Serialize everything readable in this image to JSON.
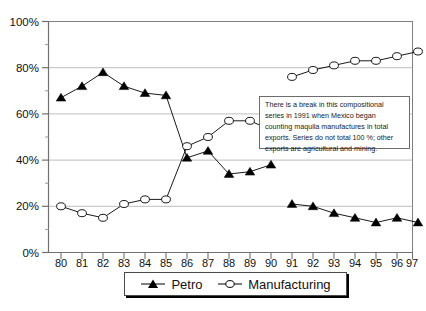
{
  "chart_data": {
    "type": "line",
    "title": "",
    "subtitle": "",
    "xlabel": "",
    "ylabel": "",
    "ylim": [
      0,
      100
    ],
    "ytick_labels": [
      "0%",
      "20%",
      "40%",
      "60%",
      "80%",
      "100%"
    ],
    "ytick_values": [
      0,
      20,
      40,
      60,
      80,
      100
    ],
    "minor_tick_values": [
      10,
      30,
      50,
      70,
      90
    ],
    "grid": "horizontal-major",
    "legend_position": "bottom",
    "axis_break": {
      "present": true,
      "between": [
        "90",
        "91"
      ],
      "reason": "Series break in 1991"
    },
    "categories": [
      "80",
      "81",
      "82",
      "83",
      "84",
      "85",
      "86",
      "87",
      "88",
      "89",
      "90",
      "91",
      "92",
      "93",
      "94",
      "95",
      "96",
      "97"
    ],
    "series": [
      {
        "name": "Petro",
        "marker": "filled-triangle",
        "color": "#000000",
        "segments": [
          {
            "x": [
              "80",
              "81",
              "82",
              "83",
              "84",
              "85",
              "86",
              "87",
              "88",
              "89",
              "90"
            ],
            "values": [
              67,
              72,
              78,
              72,
              69,
              68,
              41,
              44,
              34,
              35,
              38
            ]
          },
          {
            "x": [
              "91",
              "92",
              "93",
              "94",
              "95",
              "96",
              "97"
            ],
            "values": [
              21,
              20,
              17,
              15,
              13,
              15,
              13
            ]
          }
        ]
      },
      {
        "name": "Manufacturing",
        "marker": "open-circle",
        "color": "#000000",
        "segments": [
          {
            "x": [
              "80",
              "81",
              "82",
              "83",
              "84",
              "85",
              "86",
              "87",
              "88",
              "89",
              "90"
            ],
            "values": [
              20,
              17,
              15,
              21,
              23,
              23,
              46,
              50,
              57,
              57,
              53
            ]
          },
          {
            "x": [
              "91",
              "92",
              "93",
              "94",
              "95",
              "96",
              "97"
            ],
            "values": [
              76,
              79,
              81,
              83,
              83,
              85,
              87
            ]
          }
        ]
      }
    ],
    "annotations": [
      {
        "name": "break-note",
        "text": "There is a break in this compositional series in 1991 when Mexico began counting maquila manufactures in total exports.  Series do not total 100 %; other exports are agricultural and mining."
      }
    ]
  },
  "annotation": {
    "line1": "There is a break in this compositional",
    "line2": "series in 1991 when Mexico began",
    "line3": "counting maquila manufactures in total",
    "line4": "exports.  Series do not total 100 %; other",
    "line5": "exports are agricultural and mining."
  },
  "legend": {
    "petro_label": "Petro",
    "manufacturing_label": "Manufacturing"
  },
  "colors": {
    "series_line": "#000000",
    "grid": "#b5b5b5",
    "frame": "#707070",
    "text": "#111111"
  }
}
